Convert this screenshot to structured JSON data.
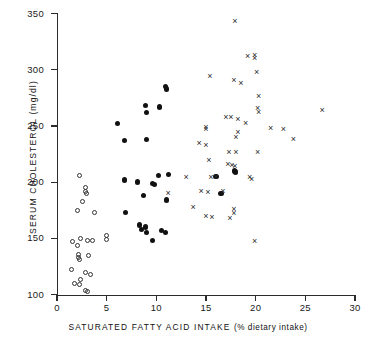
{
  "chart_data": {
    "type": "scatter",
    "title": "",
    "xlabel": "SATURATED FATTY ACID INTAKE (% dietary intake)",
    "xlabel_main": "SATURATED FATTY ACID INTAKE",
    "xlabel_paren": "(% dietary intake)",
    "ylabel": "SERUM CHOLESTEROL (mg/dl)",
    "xlim": [
      0,
      30
    ],
    "ylim": [
      100,
      350
    ],
    "xticks": [
      0,
      5,
      10,
      15,
      20,
      25,
      30
    ],
    "yticks": [
      100,
      150,
      200,
      250,
      300,
      350
    ],
    "xtick_labels": [
      "0",
      "5",
      "10",
      "15",
      "20",
      "25",
      "30"
    ],
    "ytick_labels": [
      "100",
      "150",
      "200",
      "250",
      "300",
      "350"
    ],
    "grid": false,
    "legend": "none",
    "marker_colors": {
      "open_circle": "#333333",
      "filled_circle": "#111111",
      "cross": "#2a2a2a"
    },
    "series": [
      {
        "name": "open-circle group",
        "marker": "open-circle",
        "points": [
          [
            2.3,
            206
          ],
          [
            2.9,
            195
          ],
          [
            2.9,
            192
          ],
          [
            3.0,
            190
          ],
          [
            2.1,
            175
          ],
          [
            2.6,
            183
          ],
          [
            3.8,
            173
          ],
          [
            5.0,
            153
          ],
          [
            5.0,
            149
          ],
          [
            1.6,
            147
          ],
          [
            2.1,
            144
          ],
          [
            2.4,
            150
          ],
          [
            3.1,
            148
          ],
          [
            3.6,
            148
          ],
          [
            2.2,
            136
          ],
          [
            2.2,
            133
          ],
          [
            2.3,
            131
          ],
          [
            3.2,
            135
          ],
          [
            1.5,
            122
          ],
          [
            2.9,
            120
          ],
          [
            3.4,
            118
          ],
          [
            1.8,
            110
          ],
          [
            2.3,
            109
          ],
          [
            2.4,
            113
          ],
          [
            2.9,
            104
          ],
          [
            3.1,
            103
          ]
        ]
      },
      {
        "name": "filled-circle group",
        "marker": "filled-circle",
        "points": [
          [
            10.9,
            285
          ],
          [
            11.0,
            283
          ],
          [
            8.9,
            268
          ],
          [
            9.0,
            262
          ],
          [
            10.3,
            267
          ],
          [
            6.1,
            252
          ],
          [
            6.8,
            237
          ],
          [
            9.0,
            238
          ],
          [
            6.9,
            173
          ],
          [
            6.8,
            202
          ],
          [
            8.1,
            200
          ],
          [
            9.6,
            199
          ],
          [
            9.8,
            198
          ],
          [
            11.2,
            207
          ],
          [
            10.2,
            206
          ],
          [
            8.7,
            188
          ],
          [
            11.0,
            184
          ],
          [
            16.5,
            190
          ],
          [
            16.0,
            205
          ],
          [
            17.9,
            210
          ],
          [
            18.0,
            209
          ],
          [
            8.3,
            162
          ],
          [
            8.5,
            158
          ],
          [
            8.9,
            160
          ],
          [
            9.0,
            155
          ],
          [
            10.5,
            157
          ],
          [
            10.9,
            155
          ],
          [
            9.6,
            148
          ]
        ]
      },
      {
        "name": "cross group",
        "marker": "cross",
        "points": [
          [
            17.9,
            343
          ],
          [
            19.2,
            312
          ],
          [
            19.9,
            313
          ],
          [
            19.9,
            310
          ],
          [
            15.4,
            294
          ],
          [
            17.8,
            291
          ],
          [
            18.5,
            288
          ],
          [
            20.1,
            298
          ],
          [
            20.3,
            277
          ],
          [
            20.2,
            266
          ],
          [
            20.3,
            262
          ],
          [
            17.0,
            258
          ],
          [
            17.5,
            258
          ],
          [
            18.2,
            256
          ],
          [
            19.0,
            253
          ],
          [
            15.0,
            249
          ],
          [
            15.0,
            247
          ],
          [
            21.5,
            248
          ],
          [
            22.8,
            247
          ],
          [
            26.7,
            264
          ],
          [
            18.2,
            245
          ],
          [
            18.0,
            240
          ],
          [
            23.8,
            238
          ],
          [
            14.3,
            235
          ],
          [
            15.0,
            233
          ],
          [
            17.3,
            227
          ],
          [
            18.0,
            227
          ],
          [
            20.2,
            227
          ],
          [
            15.3,
            220
          ],
          [
            17.2,
            216
          ],
          [
            17.6,
            215
          ],
          [
            17.9,
            214
          ],
          [
            13.0,
            205
          ],
          [
            15.5,
            205
          ],
          [
            16.0,
            205
          ],
          [
            19.4,
            205
          ],
          [
            19.6,
            203
          ],
          [
            11.2,
            190
          ],
          [
            14.5,
            192
          ],
          [
            15.2,
            191
          ],
          [
            16.7,
            192
          ],
          [
            13.7,
            178
          ],
          [
            17.8,
            176
          ],
          [
            17.8,
            173
          ],
          [
            15.0,
            170
          ],
          [
            15.6,
            169
          ],
          [
            17.4,
            168
          ],
          [
            19.9,
            148
          ]
        ]
      }
    ]
  }
}
